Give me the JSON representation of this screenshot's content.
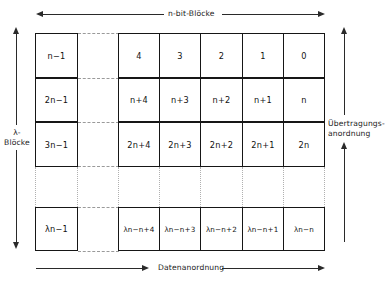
{
  "figure": {
    "labels": {
      "top": "n-bit-Blöcke",
      "bottom": "Datenanordnung",
      "left_line1": "λ-",
      "left_line2": "Blöcke",
      "right_line1": "Übertragungs-",
      "right_line2": "anordnung"
    },
    "left_column": {
      "cells": [
        {
          "text": "n−1"
        },
        {
          "text": "2n−1"
        },
        {
          "text": "3n−1"
        },
        {
          "text": "λn−1"
        }
      ]
    },
    "grid": {
      "rows": [
        {
          "cells": [
            "4",
            "3",
            "2",
            "1",
            "0"
          ]
        },
        {
          "cells": [
            "n+4",
            "n+3",
            "n+2",
            "n+1",
            "n"
          ]
        },
        {
          "cells": [
            "2n+4",
            "2n+3",
            "2n+2",
            "2n+1",
            "2n"
          ]
        },
        {
          "cells": [
            "λn−n+4",
            "λn−n+3",
            "λn−n+2",
            "λn−n+1",
            "λn−n"
          ]
        }
      ]
    },
    "colors": {
      "ink": "#161616",
      "dashed": "#9a9a9a",
      "background": "#ffffff"
    }
  }
}
